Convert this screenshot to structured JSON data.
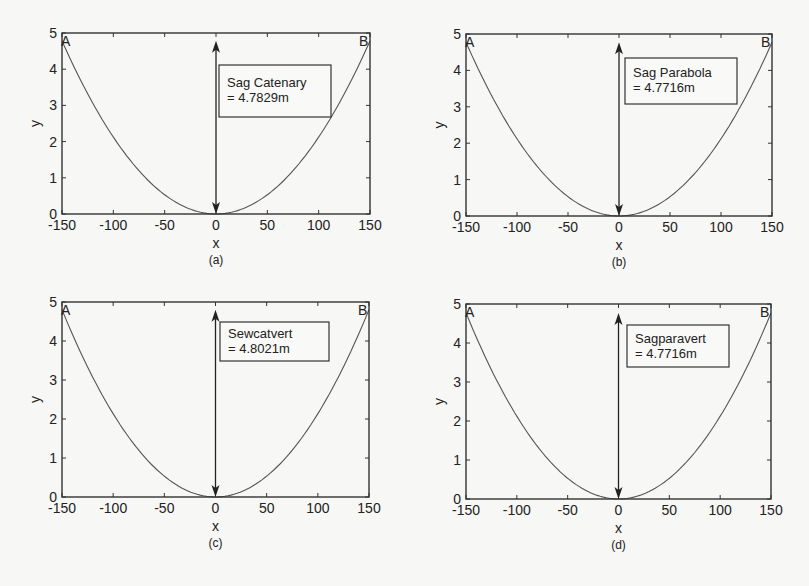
{
  "figure": {
    "background": "#f7f7f5",
    "line_color": "#555555",
    "frame_color": "#333333"
  },
  "chart_data": [
    {
      "type": "line",
      "panel": "a",
      "caption": "(a)",
      "title": "",
      "xlabel": "x",
      "ylabel": "y",
      "xlim": [
        -150,
        150
      ],
      "ylim": [
        0,
        5
      ],
      "xticks": [
        -150,
        -100,
        -50,
        0,
        50,
        100,
        150
      ],
      "yticks": [
        0,
        1,
        2,
        3,
        4,
        5
      ],
      "grid": false,
      "series": [
        {
          "name": "catenary",
          "curve": "catenary",
          "sag": 4.7829,
          "x_range": [
            -150,
            150
          ]
        }
      ],
      "points": [
        {
          "label": "A",
          "x": -150,
          "y": 4.7829
        },
        {
          "label": "B",
          "x": 150,
          "y": 4.7829
        }
      ],
      "arrow": {
        "x": 0,
        "y_from": 0,
        "y_to": 4.7829
      },
      "annotation": {
        "line1": "Sag Catenary",
        "line2": "= 4.7829m"
      },
      "box": {
        "left": 62,
        "top": 33,
        "right": 370,
        "bottom": 214
      },
      "anno_box": {
        "left": 219,
        "top": 65,
        "right": 331,
        "bottom": 117
      }
    },
    {
      "type": "line",
      "panel": "b",
      "caption": "(b)",
      "title": "",
      "xlabel": "x",
      "ylabel": "y",
      "xlim": [
        -150,
        150
      ],
      "ylim": [
        0,
        5
      ],
      "xticks": [
        -150,
        -100,
        -50,
        0,
        50,
        100,
        150
      ],
      "yticks": [
        0,
        1,
        2,
        3,
        4,
        5
      ],
      "grid": false,
      "series": [
        {
          "name": "parabola",
          "curve": "parabola",
          "sag": 4.7716,
          "x_range": [
            -150,
            150
          ]
        }
      ],
      "points": [
        {
          "label": "A",
          "x": -150,
          "y": 4.7716
        },
        {
          "label": "B",
          "x": 150,
          "y": 4.7716
        }
      ],
      "arrow": {
        "x": 0,
        "y_from": 0,
        "y_to": 4.7716
      },
      "annotation": {
        "line1": "Sag Parabola",
        "line2": "= 4.7716m"
      },
      "box": {
        "left": 466,
        "top": 34,
        "right": 772,
        "bottom": 216
      },
      "anno_box": {
        "left": 625,
        "top": 58,
        "right": 737,
        "bottom": 104
      }
    },
    {
      "type": "line",
      "panel": "c",
      "caption": "(c)",
      "title": "",
      "xlabel": "x",
      "ylabel": "y",
      "xlim": [
        -150,
        150
      ],
      "ylim": [
        0,
        5
      ],
      "xticks": [
        -150,
        -100,
        -50,
        0,
        50,
        100,
        150
      ],
      "yticks": [
        0,
        1,
        2,
        3,
        4,
        5
      ],
      "grid": false,
      "series": [
        {
          "name": "catenary-vertical",
          "curve": "catenary",
          "sag": 4.8021,
          "x_range": [
            -150,
            150
          ]
        }
      ],
      "points": [
        {
          "label": "A",
          "x": -150,
          "y": 4.8021
        },
        {
          "label": "B",
          "x": 150,
          "y": 4.8021
        }
      ],
      "arrow": {
        "x": 0,
        "y_from": 0,
        "y_to": 4.8021
      },
      "annotation": {
        "line1": "Sewcatvert",
        "line2": "= 4.8021m"
      },
      "box": {
        "left": 62,
        "top": 302,
        "right": 369,
        "bottom": 497
      },
      "anno_box": {
        "left": 220,
        "top": 322,
        "right": 329,
        "bottom": 361
      }
    },
    {
      "type": "line",
      "panel": "d",
      "caption": "(d)",
      "title": "",
      "xlabel": "x",
      "ylabel": "y",
      "xlim": [
        -150,
        150
      ],
      "ylim": [
        0,
        5
      ],
      "xticks": [
        -150,
        -100,
        -50,
        0,
        50,
        100,
        150
      ],
      "yticks": [
        0,
        1,
        2,
        3,
        4,
        5
      ],
      "grid": false,
      "series": [
        {
          "name": "parabola-vertical",
          "curve": "parabola",
          "sag": 4.7716,
          "x_range": [
            -150,
            150
          ]
        }
      ],
      "points": [
        {
          "label": "A",
          "x": -150,
          "y": 4.7716
        },
        {
          "label": "B",
          "x": 150,
          "y": 4.7716
        }
      ],
      "arrow": {
        "x": 0,
        "y_from": 0,
        "y_to": 4.7716
      },
      "annotation": {
        "line1": "Sagparavert",
        "line2": "= 4.7716m"
      },
      "box": {
        "left": 466,
        "top": 304,
        "right": 771,
        "bottom": 499
      },
      "anno_box": {
        "left": 627,
        "top": 325,
        "right": 729,
        "bottom": 367
      }
    }
  ]
}
